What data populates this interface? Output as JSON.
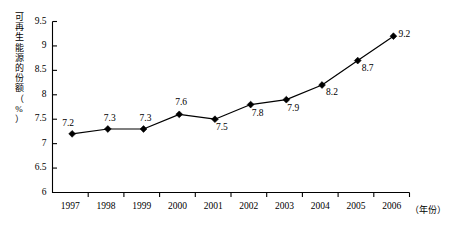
{
  "chart_data": {
    "type": "line",
    "title": "",
    "xlabel": "（年份）",
    "ylabel": "可再生能源的份额（%）",
    "categories": [
      "1997",
      "1998",
      "1999",
      "2000",
      "2001",
      "2002",
      "2003",
      "2004",
      "2005",
      "2006"
    ],
    "values": [
      7.2,
      7.3,
      7.3,
      7.6,
      7.5,
      7.8,
      7.9,
      8.2,
      8.7,
      9.2
    ],
    "point_labels": [
      "7.2",
      "7.3",
      "7.3",
      "7.6",
      "7.5",
      "7.8",
      "7.9",
      "8.2",
      "8.7",
      "9.2"
    ],
    "ylim": [
      6,
      9.5
    ],
    "yticks": [
      6,
      6.5,
      7,
      7.5,
      8,
      8.5,
      9,
      9.5
    ],
    "ytick_labels": [
      "6",
      "6.5",
      "7",
      "7.5",
      "8",
      "8.5",
      "9",
      "9.5"
    ],
    "grid": false,
    "legend": null,
    "marker": "diamond",
    "series_color": "#000000",
    "background": "#ffffff"
  },
  "axes": {
    "y_title": "可再生能源的份额（%）",
    "x_title": "（年份）"
  }
}
